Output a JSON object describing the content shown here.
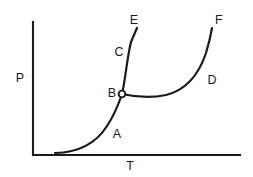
{
  "figure": {
    "kind": "phase-diagram",
    "background_color": "#ffffff",
    "stroke_color": "#1a1a1a"
  },
  "axes": {
    "y_axis_label": "P",
    "x_axis_label": "T",
    "origin": {
      "x": 33,
      "y": 155
    },
    "y_axis_top": {
      "x": 33,
      "y": 22
    },
    "x_axis_right": {
      "x": 240,
      "y": 155
    },
    "ticks": [],
    "gridlines": false
  },
  "point_labels": [
    {
      "id": "A",
      "text": "A",
      "x": 117,
      "y": 135
    },
    {
      "id": "B",
      "text": "B",
      "x": 112,
      "y": 94
    },
    {
      "id": "C",
      "text": "C",
      "x": 119,
      "y": 53
    },
    {
      "id": "D",
      "text": "D",
      "x": 212,
      "y": 81
    },
    {
      "id": "E",
      "text": "E",
      "x": 134,
      "y": 21
    },
    {
      "id": "F",
      "text": "F",
      "x": 219,
      "y": 21
    }
  ],
  "markers": [
    {
      "id": "B",
      "shape": "open-circle",
      "x": 122,
      "y": 94,
      "radius": 3.4
    }
  ],
  "chart_data": {
    "type": "line",
    "title": "",
    "xlabel": "T",
    "ylabel": "P",
    "grid": false,
    "legend": "none",
    "axis_ranges": {
      "x": [
        33,
        240
      ],
      "y": [
        155,
        22
      ]
    },
    "series": [
      {
        "name": "A",
        "label": "A",
        "description": "Lower branch rising from the T axis with increasing slope up to point B",
        "path": "M 55 153 C 76 152.5, 95 145, 107 126 C 115 114, 119 103, 122 94",
        "points": [
          {
            "x": 55,
            "y": 153
          },
          {
            "x": 73,
            "y": 152
          },
          {
            "x": 92,
            "y": 147
          },
          {
            "x": 104,
            "y": 132
          },
          {
            "x": 112,
            "y": 117
          },
          {
            "x": 118,
            "y": 104
          },
          {
            "x": 122,
            "y": 94
          }
        ]
      },
      {
        "name": "C",
        "label": "C",
        "description": "Steep branch continuing upward from point B through C to the endpoint E",
        "path": "M 122 94 C 125 82, 127 58, 131 42 L 137 28",
        "points": [
          {
            "x": 122,
            "y": 94
          },
          {
            "x": 125,
            "y": 78
          },
          {
            "x": 127,
            "y": 60
          },
          {
            "x": 131,
            "y": 43
          },
          {
            "x": 137,
            "y": 28
          }
        ]
      },
      {
        "name": "D",
        "label": "D",
        "description": "Right branch leaving point B nearly horizontally, passing a shallow minimum then rising steeply through D to the endpoint F",
        "path": "M 122 94 C 140 98, 152 98, 166 95 C 186 90, 199 74, 206 53 C 209 43, 211 34, 212 28",
        "points": [
          {
            "x": 122,
            "y": 94
          },
          {
            "x": 140,
            "y": 97
          },
          {
            "x": 158,
            "y": 97
          },
          {
            "x": 172,
            "y": 93
          },
          {
            "x": 188,
            "y": 83
          },
          {
            "x": 199,
            "y": 67
          },
          {
            "x": 206,
            "y": 50
          },
          {
            "x": 210,
            "y": 36
          },
          {
            "x": 212,
            "y": 28
          }
        ]
      }
    ],
    "annotations": [
      {
        "text": "A",
        "x": 117,
        "y": 135
      },
      {
        "text": "B",
        "x": 112,
        "y": 94
      },
      {
        "text": "C",
        "x": 119,
        "y": 53
      },
      {
        "text": "D",
        "x": 212,
        "y": 81
      },
      {
        "text": "E",
        "x": 134,
        "y": 21
      },
      {
        "text": "F",
        "x": 219,
        "y": 21
      }
    ]
  }
}
